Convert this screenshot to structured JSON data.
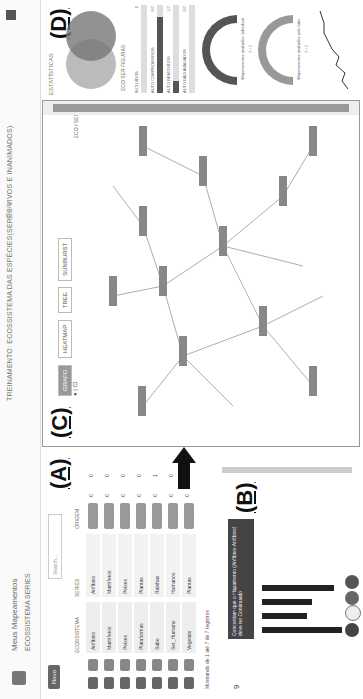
{
  "header": {
    "menu": "Meus Mapeamentos",
    "tabs": [
      "ECOSSISTEMA",
      "SERIES"
    ],
    "title": "TREINAMENTO: ECOSSISTEMA DAS ESPÉCIES(SERES VIVOS E INANIMADOS)",
    "signature": "Gaia"
  },
  "panelA": {
    "label": "(A)",
    "new_button": "Novo",
    "search_placeholder": "Search...",
    "columns": [
      "ECOSSISTEMA",
      "SERIES",
      "ORIGEM",
      "",
      ""
    ],
    "rows": [
      {
        "eco": "Anfíbios",
        "serie": "Anfíbios",
        "likes": "0",
        "dislikes": "0"
      },
      {
        "eco": "Mamíferos",
        "serie": "Mamíferos",
        "likes": "0",
        "dislikes": "0"
      },
      {
        "eco": "Peixes",
        "serie": "Peixes",
        "likes": "0",
        "dislikes": "0"
      },
      {
        "eco": "Plataformas",
        "serie": "Plantas",
        "likes": "0",
        "dislikes": "0"
      },
      {
        "eco": "Sabe",
        "serie": "Rainhas",
        "likes": "0",
        "dislikes": "1"
      },
      {
        "eco": "Ser_Humano",
        "serie": "Humanos",
        "likes": "0",
        "dislikes": "0"
      },
      {
        "eco": "Vegetais",
        "serie": "Plantas",
        "likes": "0",
        "dislikes": "0"
      }
    ],
    "pager": "Mostrando de 1 até 7 de 7 registros"
  },
  "panelB": {
    "label": "(B)",
    "count": "9",
    "tooltip": "Concordam que o Hapamento (Anfíbios-Anfíbios) deve ter Continuado",
    "bars": [
      80,
      45,
      50,
      72
    ]
  },
  "panelC": {
    "label": "(C)",
    "tabs": [
      "GRAFO",
      "HEATMAP",
      "TREE",
      "SUNBURST"
    ],
    "active_tab": "GRAFO",
    "legend": [
      "ECO",
      "SER"
    ],
    "nodes": [
      "Ser_Humano [SER]",
      "Anfíbios [ECO]",
      "Mamíferos [SER]",
      "Peixes [SER]",
      "Plantas [ECO]",
      "Rainhas [SER]",
      "Humanos [SER]",
      "Vegetais [ECO]",
      "Ave [SER]",
      "Inseto [SER]",
      "Fungos [SER]",
      "Répteis [SER]"
    ]
  },
  "panelD": {
    "label": "(D)",
    "title": "ESTATÍSTICAS",
    "venn_legend": [
      "ECO",
      "SER",
      "FIGURAS"
    ],
    "progress": [
      {
        "label": "INCLUÍDOS",
        "value": "0",
        "pct": 0
      },
      {
        "label": "AUTO COMPROMISSOS",
        "value": "6/7",
        "pct": 86
      },
      {
        "label": "AUTO REMOVIDOS",
        "value": "1/7",
        "pct": 14
      },
      {
        "label": "AUTO NÃO AVALIADOS",
        "value": "0/7",
        "pct": 0
      }
    ],
    "gauges": [
      {
        "caption": "Mapeamentos avaliados individual",
        "value": "7 / 7"
      },
      {
        "caption": "Mapeamentos avaliados pelo tutor",
        "value": "7 / 7"
      }
    ],
    "line_series": [
      2,
      4,
      3,
      6,
      5,
      7,
      8,
      9,
      9,
      10
    ]
  }
}
